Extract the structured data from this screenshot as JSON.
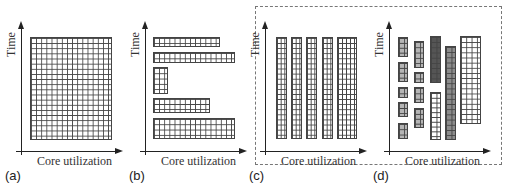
{
  "figure": {
    "axis_labels": {
      "y": "Time",
      "x": "Core utilization"
    },
    "panels": [
      {
        "id": "a",
        "label": "(a)",
        "description": "Single monolithic job occupying full core grid"
      },
      {
        "id": "b",
        "label": "(b)",
        "description": "Jobs of different widths run sequentially in time"
      },
      {
        "id": "c",
        "label": "(c)",
        "description": "Jobs run in parallel columns across cores"
      },
      {
        "id": "d",
        "label": "(d)",
        "description": "Mixed jobs of varying sizes and shades packed across cores and time"
      }
    ],
    "grouping": {
      "dashed_box_panels": [
        "c",
        "d"
      ]
    },
    "colors": {
      "grid_line": "#444444",
      "white_cell": "#ffffff",
      "light_gray_cell": "#b5b5b5",
      "medium_gray_cell": "#8c8c8c",
      "dark_gray_cell": "#555555"
    }
  }
}
